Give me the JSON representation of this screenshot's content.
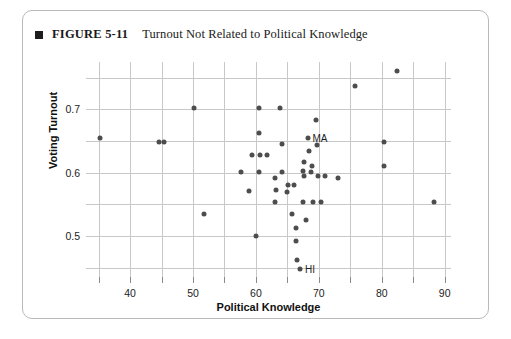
{
  "figure": {
    "marker": "square-bullet",
    "number": "FIGURE 5-11",
    "title": "Turnout Not Related to Political Knowledge"
  },
  "chart_data": {
    "type": "scatter",
    "title": "Turnout Not Related to Political Knowledge",
    "xlabel": "Political Knowledge",
    "ylabel": "Voting Turnout",
    "xlim": [
      33,
      91
    ],
    "ylim": [
      0.435,
      0.775
    ],
    "xticks": [
      40,
      50,
      60,
      70,
      80,
      90
    ],
    "yticks": [
      0.5,
      0.6,
      0.7
    ],
    "ytick_labels": [
      "0.5",
      "0.6",
      "0.7"
    ],
    "xtick_labels": [
      "40",
      "50",
      "60",
      "70",
      "80",
      "90"
    ],
    "xgrid_values": [
      35,
      40,
      45,
      50,
      55,
      60,
      65,
      70,
      75,
      80,
      85,
      90
    ],
    "ygrid_values": [
      0.45,
      0.5,
      0.55,
      0.6,
      0.65,
      0.7,
      0.75
    ],
    "grid": true,
    "legend": "none",
    "marker_color": "#4d4d4d",
    "grid_color": "#c8c8c8",
    "points": [
      {
        "x": 35.3,
        "y": 0.655,
        "label": ""
      },
      {
        "x": 44.6,
        "y": 0.648,
        "label": ""
      },
      {
        "x": 45.4,
        "y": 0.648,
        "label": ""
      },
      {
        "x": 50.1,
        "y": 0.703,
        "label": ""
      },
      {
        "x": 51.8,
        "y": 0.535,
        "label": ""
      },
      {
        "x": 57.6,
        "y": 0.601,
        "label": ""
      },
      {
        "x": 58.9,
        "y": 0.571,
        "label": ""
      },
      {
        "x": 59.4,
        "y": 0.628,
        "label": ""
      },
      {
        "x": 60.0,
        "y": 0.5,
        "label": ""
      },
      {
        "x": 60.5,
        "y": 0.601,
        "label": ""
      },
      {
        "x": 60.6,
        "y": 0.628,
        "label": ""
      },
      {
        "x": 60.5,
        "y": 0.703,
        "label": ""
      },
      {
        "x": 60.5,
        "y": 0.662,
        "label": ""
      },
      {
        "x": 61.8,
        "y": 0.628,
        "label": ""
      },
      {
        "x": 63.0,
        "y": 0.592,
        "label": ""
      },
      {
        "x": 63.2,
        "y": 0.572,
        "label": ""
      },
      {
        "x": 63.1,
        "y": 0.553,
        "label": ""
      },
      {
        "x": 64.2,
        "y": 0.645,
        "label": ""
      },
      {
        "x": 64.2,
        "y": 0.601,
        "label": ""
      },
      {
        "x": 63.9,
        "y": 0.703,
        "label": ""
      },
      {
        "x": 65.1,
        "y": 0.58,
        "label": ""
      },
      {
        "x": 65.0,
        "y": 0.57,
        "label": ""
      },
      {
        "x": 66.0,
        "y": 0.58,
        "label": ""
      },
      {
        "x": 65.8,
        "y": 0.535,
        "label": ""
      },
      {
        "x": 66.4,
        "y": 0.512,
        "label": ""
      },
      {
        "x": 66.3,
        "y": 0.492,
        "label": ""
      },
      {
        "x": 66.5,
        "y": 0.462,
        "label": ""
      },
      {
        "x": 67.0,
        "y": 0.447,
        "label": "HI"
      },
      {
        "x": 67.5,
        "y": 0.553,
        "label": ""
      },
      {
        "x": 67.9,
        "y": 0.525,
        "label": ""
      },
      {
        "x": 67.6,
        "y": 0.595,
        "label": ""
      },
      {
        "x": 67.5,
        "y": 0.602,
        "label": ""
      },
      {
        "x": 67.6,
        "y": 0.617,
        "label": ""
      },
      {
        "x": 68.2,
        "y": 0.655,
        "label": "MA"
      },
      {
        "x": 68.4,
        "y": 0.634,
        "label": ""
      },
      {
        "x": 68.7,
        "y": 0.601,
        "label": ""
      },
      {
        "x": 68.9,
        "y": 0.611,
        "label": ""
      },
      {
        "x": 69.1,
        "y": 0.553,
        "label": ""
      },
      {
        "x": 69.6,
        "y": 0.683,
        "label": ""
      },
      {
        "x": 69.7,
        "y": 0.643,
        "label": ""
      },
      {
        "x": 69.9,
        "y": 0.594,
        "label": ""
      },
      {
        "x": 70.3,
        "y": 0.553,
        "label": ""
      },
      {
        "x": 70.9,
        "y": 0.594,
        "label": ""
      },
      {
        "x": 73.0,
        "y": 0.592,
        "label": ""
      },
      {
        "x": 75.8,
        "y": 0.737,
        "label": ""
      },
      {
        "x": 80.3,
        "y": 0.648,
        "label": ""
      },
      {
        "x": 80.4,
        "y": 0.611,
        "label": ""
      },
      {
        "x": 82.4,
        "y": 0.76,
        "label": ""
      },
      {
        "x": 88.3,
        "y": 0.553,
        "label": ""
      }
    ]
  }
}
